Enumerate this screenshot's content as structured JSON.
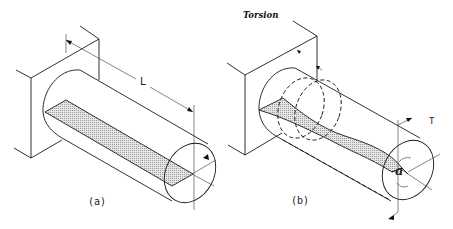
{
  "figure": {
    "title": "Torsion",
    "panels": [
      {
        "id": "a",
        "label": "(a)",
        "dimension_label": "L",
        "description": "Cylindrical shaft fixed to wall, unloaded, with shaded longitudinal plane"
      },
      {
        "id": "b",
        "label": "(b)",
        "torque_label": "T",
        "angle_label": "a",
        "description": "Same shaft under torque T, shaded plane twisted by angle"
      }
    ]
  },
  "colors": {
    "line": "#1a1a1a",
    "shade": "#d4d4d4",
    "background": "#ffffff"
  }
}
